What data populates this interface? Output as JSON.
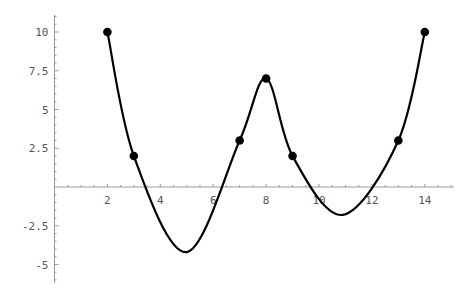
{
  "chart_data": {
    "type": "line",
    "title": "",
    "xlabel": "",
    "ylabel": "",
    "xlim": [
      0,
      15.1
    ],
    "ylim": [
      -6.2,
      11.1
    ],
    "grid": false,
    "legend": null,
    "x_ticks": [
      2,
      4,
      6,
      8,
      10,
      12,
      14
    ],
    "x_tick_labels": [
      "2",
      "4",
      "6",
      "8",
      "10",
      "12",
      "14"
    ],
    "y_ticks": [
      -5,
      -2.5,
      2.5,
      5,
      7.5,
      10
    ],
    "y_tick_labels": [
      "-5",
      "-2.5",
      "2.5",
      "5",
      "7.5",
      "10"
    ],
    "series": [
      {
        "name": "data points",
        "style": "points",
        "x": [
          2,
          3,
          7,
          8,
          9,
          13,
          14
        ],
        "y": [
          10,
          2,
          3,
          7,
          2,
          3,
          10
        ]
      },
      {
        "name": "interpolating curve",
        "style": "smooth line",
        "x": [
          2,
          3,
          5,
          7,
          8,
          9,
          10.9,
          13,
          14
        ],
        "y": [
          10,
          2,
          -4.2,
          3,
          7,
          2,
          -1.8,
          3,
          10
        ]
      }
    ]
  }
}
